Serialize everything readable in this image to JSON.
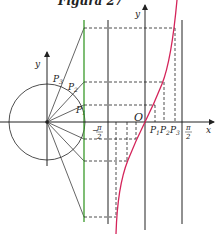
{
  "title": "Figura 27",
  "labels": {
    "unit_circle_y_axis": "y",
    "graph_y_axis": "y",
    "x_axis": "x",
    "origin": "O",
    "p1_circle": "P",
    "p1_circle_sub": "1",
    "p2_circle": "P",
    "p2_circle_sub": "2",
    "p3_circle": "P",
    "p3_circle_sub": "3",
    "p1_axis": "P",
    "p1_axis_sub": "1",
    "p2_axis": "P",
    "p2_axis_sub": "2",
    "p3_axis": "P",
    "p3_axis_sub": "3",
    "neg_half_pi_num": "π",
    "neg_half_pi_den": "2",
    "neg_sign": "−",
    "half_pi_num": "π",
    "half_pi_den": "2"
  },
  "colors": {
    "curve": "#d4245a",
    "tangent_line": "#3a9a2a",
    "ink": "#222222"
  }
}
